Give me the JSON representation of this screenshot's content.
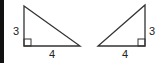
{
  "figure": {
    "left_triangle": {
      "vertical_leg_label": "3",
      "horizontal_leg_label": "4",
      "right_angle_position": "bottom-left"
    },
    "right_triangle": {
      "vertical_leg_label": "3",
      "horizontal_leg_label": "4",
      "right_angle_position": "bottom-right"
    },
    "colors": {
      "stroke": "#333333",
      "border": "#111111"
    }
  }
}
